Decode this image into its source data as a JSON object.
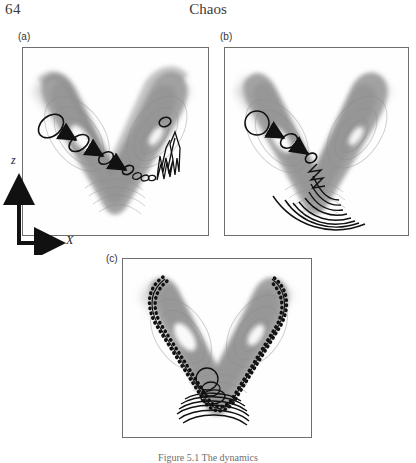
{
  "page": {
    "folio": "64",
    "running_title": "Chaos"
  },
  "axis_key": {
    "vertical_label": "z",
    "horizontal_label": "X"
  },
  "caption": "Figure 5.1 The dynamics",
  "colors": {
    "attractor_grey": "#9c9c9c",
    "attractor_grey_light": "#bdbdbd",
    "attractor_grey_dark": "#7c7c7c",
    "hole_white": "#ffffff",
    "ink_black": "#111111",
    "frame_grey": "#6e6e6e",
    "text_grey": "#3b3b3b"
  },
  "figure": {
    "panels": [
      {
        "id": "a",
        "label": "(a)",
        "label_x": 18,
        "label_y": 32,
        "frame_x": 22,
        "frame_y": 47,
        "frame_w": 187,
        "frame_h": 189,
        "description": "Lorenz attractor cross-section with a small circle of initial conditions stretching into an elongated filament along the right wing",
        "blob_ellipses": [
          {
            "cx": 28,
            "cy": 78,
            "rx": 14,
            "ry": 10,
            "rot": -40
          },
          {
            "cx": 56,
            "cy": 95,
            "rx": 11,
            "ry": 7,
            "rot": -35
          },
          {
            "cx": 83,
            "cy": 110,
            "rx": 8,
            "ry": 5.5,
            "rot": -32
          },
          {
            "cx": 105,
            "cy": 122,
            "rx": 6,
            "ry": 4,
            "rot": -30
          },
          {
            "cx": 142,
            "cy": 74,
            "rx": 6,
            "ry": 4.5,
            "rot": -20
          }
        ],
        "arrows": [
          {
            "x1": 40,
            "y1": 84,
            "x2": 54,
            "y2": 92
          },
          {
            "x1": 67,
            "y1": 100,
            "x2": 81,
            "y2": 108
          },
          {
            "x1": 90,
            "y1": 114,
            "x2": 104,
            "y2": 122
          }
        ],
        "filament_type": "zigzag-fold"
      },
      {
        "id": "b",
        "label": "(b)",
        "label_x": 220,
        "label_y": 32,
        "frame_x": 224,
        "frame_y": 47,
        "frame_w": 185,
        "frame_h": 189,
        "description": "The circle has stretched further and the filament has folded into a family of nested arcs sweeping across the bottom of the V",
        "blob_ellipses": [
          {
            "cx": 32,
            "cy": 75,
            "rx": 13,
            "ry": 11,
            "rot": 0
          },
          {
            "cx": 64,
            "cy": 93,
            "rx": 9,
            "ry": 6.5,
            "rot": -30
          },
          {
            "cx": 86,
            "cy": 110,
            "rx": 6,
            "ry": 4.5,
            "rot": -30
          }
        ],
        "arrows": [
          {
            "x1": 45,
            "y1": 82,
            "x2": 60,
            "y2": 90
          },
          {
            "x1": 73,
            "y1": 99,
            "x2": 84,
            "y2": 106
          }
        ],
        "arc_count": 9
      },
      {
        "id": "c",
        "label": "(c)",
        "label_x": 106,
        "label_y": 256,
        "frame_x": 122,
        "frame_y": 258,
        "frame_w": 190,
        "frame_h": 180,
        "description": "The filament has wrapped all the way around the outer boundary of the attractor, forming a beaded dotted outline with tightly nested folds at the bottom",
        "outline_style": "beaded-dotted",
        "inner_fold_count": 7
      }
    ]
  }
}
